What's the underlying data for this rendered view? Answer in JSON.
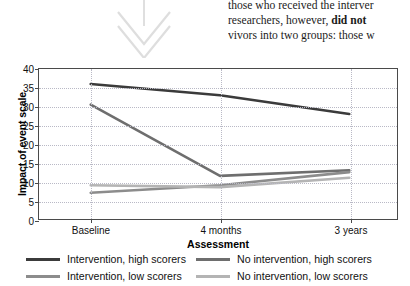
{
  "document_excerpt": {
    "lines": [
      "those who received the interver",
      "researchers, however, did not",
      "vivors into two groups: those w"
    ],
    "bold_fragment": "did not",
    "line1": "those who received the interver",
    "line2_pre": "researchers, however, ",
    "line2_bold": "did not",
    "line3": "vivors into two groups: those w"
  },
  "annotation": {
    "arrow_name": "double-chevron-down-arrow",
    "color": "#dcdcdc"
  },
  "chart_data": {
    "type": "line",
    "title": "",
    "xlabel": "Assessment",
    "ylabel": "Impact of event scale",
    "categories": [
      "Baseline",
      "4 months",
      "3 years"
    ],
    "ylim": [
      0,
      40
    ],
    "yticks": [
      0,
      5,
      10,
      15,
      20,
      25,
      30,
      35,
      40
    ],
    "ytick_labels": [
      "0",
      "5",
      "10",
      "15",
      "20",
      "25",
      "30",
      "35",
      "40"
    ],
    "grid": true,
    "legend_position": "bottom",
    "series": [
      {
        "name": "Intervention, high scorers",
        "values": [
          36,
          33,
          28
        ],
        "color": "#3b3b3b"
      },
      {
        "name": "No intervention, high scorers",
        "values": [
          30.5,
          11.5,
          13
        ],
        "color": "#6e6e6e"
      },
      {
        "name": "Intervention, low scorers",
        "values": [
          7,
          9,
          12.5
        ],
        "color": "#8c8c8c"
      },
      {
        "name": "No intervention, low scorers",
        "values": [
          9,
          8.5,
          11
        ],
        "color": "#b4b4b4"
      }
    ]
  }
}
